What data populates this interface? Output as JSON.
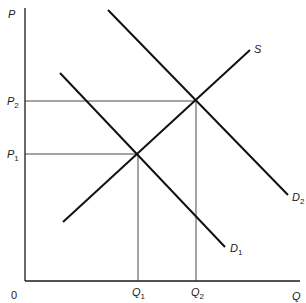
{
  "diagram": {
    "type": "supply-demand",
    "axes": {
      "y_label": "P",
      "x_label": "Q",
      "origin_label": "0"
    },
    "price_levels": [
      {
        "name": "P",
        "sub": "1",
        "y": 154
      },
      {
        "name": "P",
        "sub": "2",
        "y": 101
      }
    ],
    "quantity_levels": [
      {
        "name": "Q",
        "sub": "1",
        "x": 138
      },
      {
        "name": "Q",
        "sub": "2",
        "x": 196
      }
    ],
    "curves": [
      {
        "id": "supply",
        "label": "S",
        "x1": 63,
        "y1": 222,
        "x2": 250,
        "y2": 50
      },
      {
        "id": "demand-1",
        "label": "D",
        "sub": "1",
        "x1": 60,
        "y1": 73,
        "x2": 225,
        "y2": 247
      },
      {
        "id": "demand-2",
        "label": "D",
        "sub": "2",
        "x1": 108,
        "y1": 10,
        "x2": 288,
        "y2": 195
      }
    ],
    "equilibria": [
      {
        "name": "E1",
        "x": 137,
        "y": 154
      },
      {
        "name": "E2",
        "x": 195,
        "y": 101
      }
    ],
    "colors": {
      "line": "#1a1a1a",
      "guide": "#333333",
      "background": "#ffffff"
    }
  }
}
